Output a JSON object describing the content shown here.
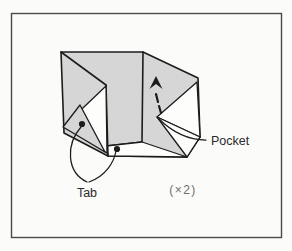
{
  "figure": {
    "type": "origami-instruction-step",
    "labels": {
      "pocket": "Pocket",
      "tab": "Tab",
      "multiplier": "(×2)"
    }
  },
  "colors": {
    "background": "#fbfbf9",
    "paper_shaded": "#d6d6d6",
    "paper_white": "#fdfdfc",
    "line": "#1c1c1c",
    "frame": "#4a4a4a",
    "label_text": "#2a2a2a",
    "multiplier_text": "#6e6e6e"
  }
}
